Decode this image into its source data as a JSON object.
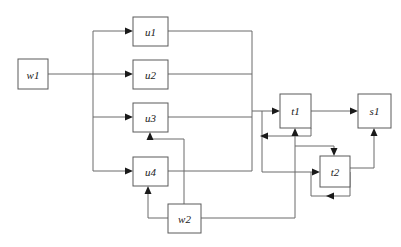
{
  "diagram": {
    "background_color": "#ffffff",
    "box_stroke_color": "#5a5a5a",
    "edge_color": "#6b6b6b",
    "arrowhead_color": "#1a1a1a",
    "label_color": "#1a1a1a",
    "nodes": [
      {
        "id": "w1",
        "label": "w1",
        "x": 18,
        "y": 59,
        "w": 30,
        "h": 30
      },
      {
        "id": "u1",
        "label": "u1",
        "x": 133,
        "y": 17,
        "w": 35,
        "h": 29
      },
      {
        "id": "u2",
        "label": "u2",
        "x": 133,
        "y": 60,
        "w": 35,
        "h": 29
      },
      {
        "id": "u3",
        "label": "u3",
        "x": 133,
        "y": 103,
        "w": 35,
        "h": 29
      },
      {
        "id": "u4",
        "label": "u4",
        "x": 133,
        "y": 157,
        "w": 35,
        "h": 29
      },
      {
        "id": "w2",
        "label": "w2",
        "x": 168,
        "y": 204,
        "w": 33,
        "h": 29
      },
      {
        "id": "t1",
        "label": "t1",
        "x": 280,
        "y": 94,
        "w": 31,
        "h": 34
      },
      {
        "id": "t2",
        "label": "t2",
        "x": 320,
        "y": 156,
        "w": 30,
        "h": 31
      },
      {
        "id": "s1",
        "label": "s1",
        "x": 358,
        "y": 94,
        "w": 33,
        "h": 34
      }
    ],
    "edges": [
      {
        "from": "w1",
        "to": "u1",
        "name": "edge-w1-u1"
      },
      {
        "from": "w1",
        "to": "u2",
        "name": "edge-w1-u2"
      },
      {
        "from": "w1",
        "to": "u3",
        "name": "edge-w1-u3"
      },
      {
        "from": "w1",
        "to": "u4",
        "name": "edge-w1-u4"
      },
      {
        "from": "u1",
        "to": "t1",
        "name": "edge-u1-t1"
      },
      {
        "from": "u2",
        "to": "t1",
        "name": "edge-u2-t1"
      },
      {
        "from": "u3",
        "to": "t1",
        "name": "edge-u3-t1"
      },
      {
        "from": "u4",
        "to": "t2",
        "name": "edge-u4-t2"
      },
      {
        "from": "w2",
        "to": "u3",
        "name": "edge-w2-u3"
      },
      {
        "from": "w2",
        "to": "u4",
        "name": "edge-w2-u4"
      },
      {
        "from": "w2",
        "to": "t1",
        "name": "edge-w2-t1"
      },
      {
        "from": "w2",
        "to": "t2",
        "name": "edge-w2-t2"
      },
      {
        "from": "t1",
        "to": "s1",
        "name": "edge-t1-s1"
      },
      {
        "from": "t1",
        "to": "t1",
        "name": "edge-t1-self-loop"
      },
      {
        "from": "t2",
        "to": "t2",
        "name": "edge-t2-self-loop"
      },
      {
        "from": "t2",
        "to": "s1",
        "name": "edge-t2-s1"
      }
    ]
  }
}
